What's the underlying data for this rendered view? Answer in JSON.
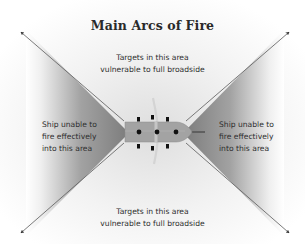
{
  "title": "Main Arcs of Fire",
  "labels": {
    "top": [
      "Targets in this area",
      "vulnerable to full broadside"
    ],
    "bottom": [
      "Targets in this area",
      "vulnerable to full broadside"
    ],
    "left": [
      "Ship unable to",
      "fire effectively",
      "into this area"
    ],
    "right": [
      "Ship unable to",
      "fire effectively",
      "into this area"
    ]
  },
  "colors": {
    "background": "#ffffff",
    "wedge_dark": "#8a8a8a",
    "wedge_light": "#ffffff",
    "hull": "#a3a3a3",
    "hull_outline": "#8c8c8c",
    "gun": "#111111",
    "arrow": "#555555",
    "text": "#2e2e2e"
  },
  "ship": {
    "gun_ports": 3,
    "guns_per_side": 3
  }
}
